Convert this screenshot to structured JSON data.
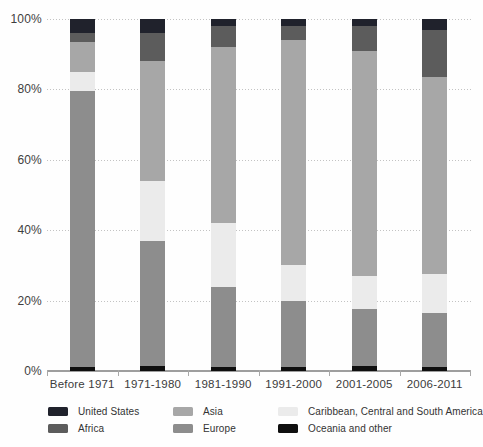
{
  "chart_data": {
    "type": "bar",
    "subtype": "stacked-100-percent",
    "title": "",
    "xlabel": "",
    "ylabel": "",
    "categories": [
      "Before 1971",
      "1971-1980",
      "1981-1990",
      "1991-2000",
      "2001-2005",
      "2006-2011"
    ],
    "series": [
      {
        "name": "United States",
        "color": "#20222c",
        "values": [
          4,
          4,
          2,
          2,
          2,
          3
        ]
      },
      {
        "name": "Africa",
        "color": "#5c5c5c",
        "values": [
          2.5,
          8,
          6,
          4,
          7,
          13.5
        ]
      },
      {
        "name": "Asia",
        "color": "#a7a7a7",
        "values": [
          8.5,
          34,
          50,
          64,
          64,
          56
        ]
      },
      {
        "name": "Europe",
        "color": "#8d8d8d",
        "values": [
          78.5,
          35.5,
          23,
          19,
          16,
          15.5
        ]
      },
      {
        "name": "Caribbean, Central and South America",
        "color": "#ebebeb",
        "values": [
          5.5,
          17,
          18,
          10,
          9.5,
          11
        ]
      },
      {
        "name": "Oceania and other",
        "color": "#0f0f0f",
        "values": [
          1,
          1.5,
          1,
          1,
          1.5,
          1
        ]
      }
    ],
    "stack_order_bottom_to_top": [
      "Oceania and other",
      "Europe",
      "Caribbean, Central and South America",
      "Asia",
      "Africa",
      "United States"
    ],
    "y_ticks": [
      "100%",
      "80%",
      "60%",
      "40%",
      "20%",
      "0%"
    ],
    "ylim": [
      0,
      100
    ],
    "grid": "dotted-horizontal",
    "legend_position": "bottom"
  },
  "legend": {
    "rows": [
      [
        "United States",
        "Asia",
        "Caribbean, Central and South America"
      ],
      [
        "Africa",
        "Europe",
        "Oceania and other"
      ]
    ]
  }
}
